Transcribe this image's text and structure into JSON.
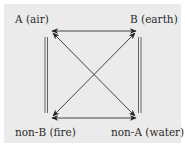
{
  "diagram": {
    "type": "square-of-opposition",
    "nodes": {
      "top_left": "A (air)",
      "top_right": "B (earth)",
      "bottom_left": "non-B (fire)",
      "bottom_right": "non-A (water)"
    },
    "edges": [
      {
        "from": "A (air)",
        "to": "B (earth)",
        "style": "double-headed-arrow"
      },
      {
        "from": "non-B (fire)",
        "to": "non-A (water)",
        "style": "double-headed-arrow"
      },
      {
        "from": "A (air)",
        "to": "non-A (water)",
        "style": "double-headed-arrow"
      },
      {
        "from": "B (earth)",
        "to": "non-B (fire)",
        "style": "double-headed-arrow"
      },
      {
        "from": "A (air)",
        "to": "non-B (fire)",
        "style": "double-line"
      },
      {
        "from": "B (earth)",
        "to": "non-A (water)",
        "style": "double-line"
      }
    ],
    "colors": {
      "background": "#ebebeb",
      "line": "#333333",
      "text": "#2a2a2a"
    }
  }
}
